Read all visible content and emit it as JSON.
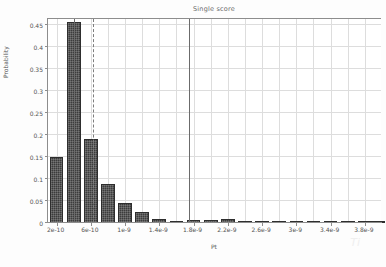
{
  "chart_data": {
    "type": "bar",
    "title": "Single score",
    "xlabel": "Pt",
    "ylabel": "Probability",
    "grid": true,
    "legend": null,
    "ylim": [
      0,
      0.465
    ],
    "yticks": [
      "0",
      "0.05",
      "0.1",
      "0.15",
      "0.2",
      "0.25",
      "0.3",
      "0.35",
      "0.4",
      "0.45"
    ],
    "ytick_values": [
      0,
      0.05,
      0.1,
      0.15,
      0.2,
      0.25,
      0.3,
      0.35,
      0.4,
      0.45
    ],
    "xlim": [
      1e-10,
      4e-09
    ],
    "xticks": [
      "2e-10",
      "6e-10",
      "1e-9",
      "1.4e-9",
      "1.8e-9",
      "2.2e-9",
      "2.6e-9",
      "3e-9",
      "3.4e-9",
      "3.8e-9"
    ],
    "xtick_values": [
      2e-10,
      6e-10,
      1e-09,
      1.4e-09,
      1.8e-09,
      2.2e-09,
      2.6e-09,
      3e-09,
      3.4e-09,
      3.8e-09
    ],
    "x": [
      2e-10,
      4e-10,
      6e-10,
      8e-10,
      1e-09,
      1.2e-09,
      1.4e-09,
      1.6e-09,
      1.8e-09,
      2e-09,
      2.2e-09,
      2.4e-09,
      2.6e-09,
      2.8e-09,
      3e-09,
      3.2e-09,
      3.4e-09,
      3.6e-09,
      3.8e-09,
      3.95e-09
    ],
    "values": [
      0.15,
      0.455,
      0.19,
      0.088,
      0.045,
      0.025,
      0.009,
      0.005,
      0.007,
      0.006,
      0.008,
      0.002,
      0.0005,
      0.002,
      0.002,
      0.0008,
      0.003,
      0.0005,
      0.0008,
      0.0005
    ],
    "annotations": [
      {
        "name": "reference-line-solid-left",
        "style": "solid",
        "x": 4e-10
      },
      {
        "name": "reference-line-dashed",
        "style": "dashed",
        "x": 6.2e-10
      },
      {
        "name": "reference-line-solid-right",
        "style": "solid",
        "x": 1.75e-09
      }
    ],
    "colors": {
      "bar": "#3c3c3c",
      "bar_edge": "#2e2e2e",
      "grid": "#dddddd",
      "axis": "#8d8d8d",
      "text": "#555555",
      "title": "#6a6a6a",
      "background": "#ffffff"
    }
  },
  "watermark": "Ti"
}
